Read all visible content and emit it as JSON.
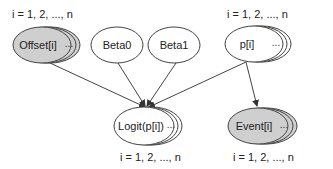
{
  "colors": {
    "observed_fill": "#cfcfcf",
    "latent_fill": "#ffffff",
    "stroke": "#444444"
  },
  "nodes": {
    "offset": {
      "label": "Offset[i]",
      "plate": "i = 1, 2, ..., n",
      "observed": true
    },
    "beta0": {
      "label": "Beta0"
    },
    "beta1": {
      "label": "Beta1"
    },
    "p": {
      "label": "p[i]",
      "plate": "i = 1, 2, ..., n"
    },
    "logit": {
      "label": "Logit(p[i])",
      "plate": "i = 1, 2, ..., n"
    },
    "event": {
      "label": "Event[i]",
      "plate": "i = 1, 2, ..., n",
      "observed": true
    }
  },
  "ellipsis": "...",
  "edges": [
    {
      "from": "offset",
      "to": "logit"
    },
    {
      "from": "beta0",
      "to": "logit"
    },
    {
      "from": "beta1",
      "to": "logit"
    },
    {
      "from": "p",
      "to": "logit"
    },
    {
      "from": "p",
      "to": "event"
    }
  ]
}
